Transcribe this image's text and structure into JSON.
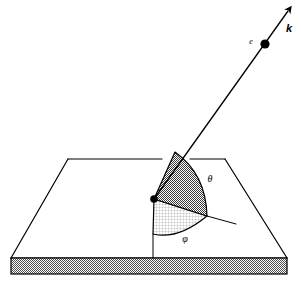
{
  "figure": {
    "background_color": "#ffffff",
    "line_color": "#000000",
    "labels": {
      "wavevector": "k",
      "electron": "e",
      "polar_angle": "θ",
      "azimuthal_angle": "φ"
    },
    "label_positions": {
      "wavevector": {
        "x": 286,
        "y": 32
      },
      "electron": {
        "x": 251,
        "y": 44
      },
      "polar_angle": {
        "x": 210,
        "y": 182
      },
      "azimuthal_angle": {
        "x": 185,
        "y": 242
      }
    },
    "colors": {
      "polar_sector_fill": "#8c8c8c",
      "azimuthal_sector_fill": "#d8d8d8",
      "slab_edge_fill": "#9e9e9e",
      "stroke": "#000000",
      "slab_top_fill": "#ffffff"
    },
    "geometry": {
      "origin_point": {
        "x": 154,
        "y": 199
      },
      "electron_point": {
        "x": 265,
        "y": 44
      },
      "arrow_tip": {
        "x": 292,
        "y": 7
      },
      "slab_top_face": [
        {
          "x": 68,
          "y": 159
        },
        {
          "x": 225,
          "y": 159
        },
        {
          "x": 287,
          "y": 258
        },
        {
          "x": 11,
          "y": 258
        }
      ],
      "slab_front_edge": {
        "left": 11,
        "right": 287,
        "top": 258,
        "bottom": 274
      },
      "polar_sector": {
        "apex": {
          "x": 175,
          "y": 152
        },
        "arc_end": {
          "x": 207,
          "y": 216
        }
      },
      "azimuthal_sector": {
        "left_edge_end": {
          "x": 153,
          "y": 234
        },
        "arc_end": {
          "x": 207,
          "y": 216
        }
      },
      "azimuthal_reference_line": {
        "from": {
          "x": 207,
          "y": 216
        },
        "to": {
          "x": 236,
          "y": 224
        }
      },
      "vertical_drop_line": {
        "from": {
          "x": 153,
          "y": 234
        },
        "to": {
          "x": 153,
          "y": 258
        }
      }
    },
    "stroke_widths": {
      "slab_outline": 1.2,
      "vector_line": 1.3,
      "sector_outline": 1.2,
      "thin_line": 1.0
    }
  }
}
